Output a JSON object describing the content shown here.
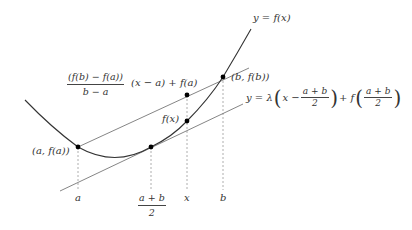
{
  "diagram": {
    "curve": {
      "label": "y = f(x)",
      "color": "#333333"
    },
    "secant_line": {
      "label_numerator": "(f(b) − f(a))",
      "label_denominator": "b − a",
      "label_suffix": "(x − a) + f(a)",
      "color": "#666666"
    },
    "tangent_line": {
      "label_prefix": "y = λ",
      "label_x": "x −",
      "label_frac_num": "a + b",
      "label_frac_den": "2",
      "label_plus_f": "+ f",
      "color": "#666666"
    },
    "points": [
      {
        "label": "(a, f(a))",
        "x": 78,
        "y": 147
      },
      {
        "label": "midpoint",
        "x": 151,
        "y": 147
      },
      {
        "label": "f(x)",
        "x": 187,
        "y": 121
      },
      {
        "label": "secant at x",
        "x": 187,
        "y": 95
      },
      {
        "label": "(b, f(b))",
        "x": 223,
        "y": 77
      }
    ],
    "axis_labels": {
      "a": "a",
      "mid_num": "a + b",
      "mid_den": "2",
      "x": "x",
      "b": "b"
    },
    "point_labels": {
      "a_fa": "(a, f(a))",
      "fx": "f(x)",
      "b_fb": "(b, f(b))"
    }
  }
}
